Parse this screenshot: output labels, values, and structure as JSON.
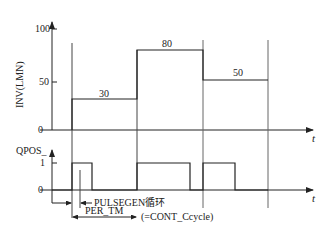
{
  "diagram": {
    "upper_chart": {
      "y_axis_label": "INV(LMN)",
      "y_ticks": [
        "100",
        "50",
        "0"
      ],
      "x_axis_label": "t",
      "segments": [
        {
          "value_label": "30"
        },
        {
          "value_label": "80"
        },
        {
          "value_label": "50"
        }
      ]
    },
    "lower_chart": {
      "y_axis_label": "QPOS_",
      "y_ticks": [
        "1",
        "0"
      ],
      "x_axis_label": "t"
    },
    "annotations": {
      "pulsegen_cycle": "PULSEGEN循环",
      "per_tm": "PER_TM",
      "cont_ccycle": "(=CONT_Ccycle)"
    },
    "colors": {
      "line": "#222222",
      "guide": "#666666",
      "background": "#ffffff"
    }
  }
}
